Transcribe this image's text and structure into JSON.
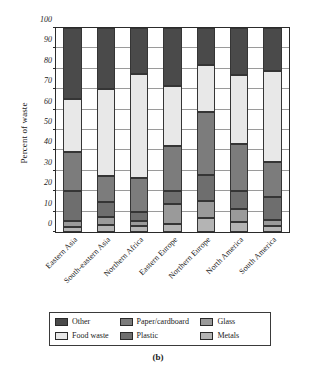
{
  "caption": "(b)",
  "chart_data": {
    "type": "bar",
    "subtype": "stacked-bar-100",
    "title": "",
    "xlabel": "",
    "ylabel": "Percent of waste",
    "ylim": [
      0,
      100
    ],
    "ytick_step": 10,
    "yticks": [
      0,
      10,
      20,
      30,
      40,
      50,
      60,
      70,
      80,
      90,
      100
    ],
    "grid": true,
    "legend_position": "bottom",
    "categories": [
      "Eastern Asia",
      "South-eastern Asia",
      "Northern Africa",
      "Eastern Europe",
      "Northern Europe",
      "North America",
      "South America"
    ],
    "series": [
      {
        "name": "Metals",
        "color": "#b4b4b4",
        "values": [
          2.5,
          3.5,
          3.0,
          4.0,
          7.0,
          5.0,
          3.0
        ]
      },
      {
        "name": "Glass",
        "color": "#9a9a9a",
        "values": [
          3.0,
          4.0,
          2.5,
          9.5,
          8.0,
          6.5,
          3.0
        ]
      },
      {
        "name": "Plastic",
        "color": "#6e6e6e",
        "values": [
          14.5,
          7.0,
          4.5,
          6.5,
          13.0,
          8.5,
          11.0
        ]
      },
      {
        "name": "Paper/cardboard",
        "color": "#7c7c7c",
        "values": [
          19.0,
          13.0,
          16.5,
          22.0,
          31.0,
          23.0,
          17.5
        ]
      },
      {
        "name": "Food waste",
        "color": "#e8e8e8",
        "values": [
          26.0,
          42.5,
          51.0,
          29.5,
          23.0,
          34.0,
          44.5
        ]
      },
      {
        "name": "Other",
        "color": "#4a4a4a",
        "values": [
          35.0,
          30.0,
          22.5,
          28.5,
          18.0,
          23.0,
          21.0
        ]
      }
    ],
    "cumulative_tops": {
      "Eastern Asia": {
        "Metals": 2.5,
        "Glass": 5.5,
        "Plastic": 20.0,
        "Paper/cardboard": 39.0,
        "Food waste": 65.0,
        "Other": 100
      },
      "South-eastern Asia": {
        "Metals": 3.5,
        "Glass": 7.5,
        "Plastic": 14.5,
        "Paper/cardboard": 27.5,
        "Food waste": 70.0,
        "Other": 100
      },
      "Northern Africa": {
        "Metals": 3.0,
        "Glass": 5.5,
        "Plastic": 10.0,
        "Paper/cardboard": 26.5,
        "Food waste": 77.5,
        "Other": 100
      },
      "Eastern Europe": {
        "Metals": 4.0,
        "Glass": 13.5,
        "Plastic": 20.0,
        "Paper/cardboard": 42.0,
        "Food waste": 71.5,
        "Other": 100
      },
      "Northern Europe": {
        "Metals": 7.0,
        "Glass": 15.0,
        "Plastic": 28.0,
        "Paper/cardboard": 59.0,
        "Food waste": 82.0,
        "Other": 100
      },
      "North America": {
        "Metals": 5.0,
        "Glass": 11.5,
        "Plastic": 20.0,
        "Paper/cardboard": 43.0,
        "Food waste": 77.0,
        "Other": 100
      },
      "South America": {
        "Metals": 3.0,
        "Glass": 6.0,
        "Plastic": 17.0,
        "Paper/cardboard": 34.5,
        "Food waste": 79.0,
        "Other": 100
      }
    },
    "legend_order": [
      "Other",
      "Paper/cardboard",
      "Glass",
      "Food waste",
      "Plastic",
      "Metals"
    ],
    "colors": {
      "other": "#4a4a4a",
      "food_waste": "#e8e8e8",
      "paper_cardboard": "#7c7c7c",
      "plastic": "#6e6e6e",
      "glass": "#9a9a9a",
      "metals": "#b4b4b4",
      "axis": "#2a2a2a",
      "grid": "#9a9a9a"
    }
  }
}
